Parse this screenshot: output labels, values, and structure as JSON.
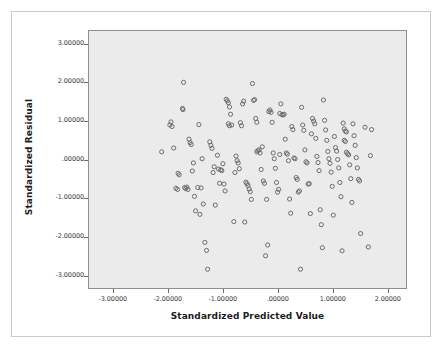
{
  "chart_data": {
    "type": "scatter",
    "title": "",
    "xlabel": "Standardized Predicted Value",
    "ylabel": "Standardized Residual",
    "xlim": [
      -3.45,
      2.35
    ],
    "ylim": [
      -3.35,
      3.35
    ],
    "xticks": [
      -3,
      -2,
      -1,
      0,
      1,
      2
    ],
    "yticks": [
      3,
      2,
      1,
      0,
      -1,
      -2,
      -3
    ],
    "xtick_labels": [
      "-3.00000",
      "-2.00000",
      "-1.00000",
      ".00000",
      "1.00000",
      "2.00000"
    ],
    "ytick_labels": [
      "3.00000",
      "2.00000",
      "1.00000",
      ".00000",
      "-1.00000",
      "-2.00000",
      "-3.00000"
    ],
    "grid": false,
    "legend": null,
    "marker": "open-circle",
    "marker_color": "#6b6b6b",
    "plot_background": "#ebebeb",
    "plot_border_color": "#8e8e8e",
    "page_background": "#ffffff",
    "n_points": 172,
    "points": [
      [
        -2.12,
        0.2
      ],
      [
        -1.95,
        0.98
      ],
      [
        -1.97,
        0.9
      ],
      [
        -1.93,
        0.86
      ],
      [
        -1.9,
        0.3
      ],
      [
        -1.72,
        2.01
      ],
      [
        -1.74,
        1.33
      ],
      [
        -1.73,
        1.3
      ],
      [
        -1.82,
        -0.36
      ],
      [
        -1.8,
        -0.4
      ],
      [
        -1.86,
        -0.75
      ],
      [
        -1.83,
        -0.78
      ],
      [
        -1.7,
        -0.73
      ],
      [
        -1.68,
        -0.76
      ],
      [
        -1.66,
        -0.72
      ],
      [
        -1.64,
        -0.78
      ],
      [
        -1.62,
        0.53
      ],
      [
        -1.6,
        0.44
      ],
      [
        -1.58,
        0.39
      ],
      [
        -1.56,
        -0.3
      ],
      [
        -1.54,
        -0.09
      ],
      [
        -1.52,
        -0.96
      ],
      [
        -1.5,
        -1.34
      ],
      [
        -1.46,
        -0.73
      ],
      [
        -1.44,
        0.91
      ],
      [
        -1.42,
        -1.43
      ],
      [
        -1.4,
        -0.74
      ],
      [
        -1.38,
        0.02
      ],
      [
        -1.36,
        -1.16
      ],
      [
        -1.33,
        -2.16
      ],
      [
        -1.3,
        -2.37
      ],
      [
        -1.28,
        -2.86
      ],
      [
        -1.24,
        0.46
      ],
      [
        -1.22,
        0.37
      ],
      [
        -1.2,
        0.29
      ],
      [
        -1.18,
        -0.34
      ],
      [
        -1.16,
        -0.19
      ],
      [
        -1.14,
        -1.19
      ],
      [
        -1.1,
        0.11
      ],
      [
        -1.08,
        -0.25
      ],
      [
        -1.06,
        -0.62
      ],
      [
        -1.04,
        -0.27
      ],
      [
        -1.02,
        -0.29
      ],
      [
        -1.0,
        -0.11
      ],
      [
        -0.98,
        -0.64
      ],
      [
        -0.96,
        -0.82
      ],
      [
        -0.94,
        1.57
      ],
      [
        -0.92,
        1.53
      ],
      [
        -0.9,
        1.48
      ],
      [
        -0.88,
        1.37
      ],
      [
        -0.86,
        1.18
      ],
      [
        -0.9,
        0.93
      ],
      [
        -0.88,
        0.88
      ],
      [
        -0.84,
        0.9
      ],
      [
        -0.8,
        -1.62
      ],
      [
        -0.78,
        -0.34
      ],
      [
        -0.76,
        0.09
      ],
      [
        -0.74,
        -0.03
      ],
      [
        -0.72,
        -0.09
      ],
      [
        -0.7,
        -0.24
      ],
      [
        -0.68,
        0.96
      ],
      [
        -0.66,
        0.88
      ],
      [
        -0.64,
        1.45
      ],
      [
        -0.62,
        1.52
      ],
      [
        -0.6,
        -1.63
      ],
      [
        -0.58,
        -0.59
      ],
      [
        -0.56,
        -0.63
      ],
      [
        -0.54,
        -0.68
      ],
      [
        -0.52,
        -0.77
      ],
      [
        -0.5,
        -0.84
      ],
      [
        -0.48,
        -1.04
      ],
      [
        -0.46,
        1.98
      ],
      [
        -0.44,
        1.54
      ],
      [
        -0.42,
        1.56
      ],
      [
        -0.4,
        1.07
      ],
      [
        -0.38,
        0.97
      ],
      [
        -0.36,
        0.23
      ],
      [
        -0.38,
        0.2
      ],
      [
        -0.34,
        0.25
      ],
      [
        -0.32,
        0.17
      ],
      [
        -0.3,
        -0.26
      ],
      [
        -0.28,
        0.33
      ],
      [
        -0.26,
        -0.56
      ],
      [
        -0.24,
        -0.62
      ],
      [
        -0.22,
        -2.51
      ],
      [
        -0.2,
        -1.04
      ],
      [
        -0.18,
        -2.23
      ],
      [
        -0.16,
        1.25
      ],
      [
        -0.14,
        1.29
      ],
      [
        -0.12,
        1.23
      ],
      [
        -0.1,
        0.97
      ],
      [
        -0.08,
        0.17
      ],
      [
        -0.06,
        0.02
      ],
      [
        -0.04,
        -0.23
      ],
      [
        -0.02,
        -0.6
      ],
      [
        0.0,
        -0.85
      ],
      [
        0.02,
        -0.78
      ],
      [
        0.04,
        0.13
      ],
      [
        0.06,
        1.45
      ],
      [
        0.04,
        1.2
      ],
      [
        0.08,
        1.17
      ],
      [
        0.1,
        1.16
      ],
      [
        0.12,
        1.18
      ],
      [
        0.14,
        0.53
      ],
      [
        0.16,
        0.17
      ],
      [
        0.18,
        0.14
      ],
      [
        0.2,
        -0.03
      ],
      [
        0.22,
        -1.03
      ],
      [
        0.24,
        -1.4
      ],
      [
        0.26,
        0.86
      ],
      [
        0.28,
        0.78
      ],
      [
        0.3,
        0.04
      ],
      [
        0.32,
        0.02
      ],
      [
        0.34,
        -0.47
      ],
      [
        0.36,
        -0.52
      ],
      [
        0.38,
        -0.85
      ],
      [
        0.4,
        -0.82
      ],
      [
        0.42,
        -2.86
      ],
      [
        0.44,
        1.36
      ],
      [
        0.46,
        0.9
      ],
      [
        0.48,
        0.76
      ],
      [
        0.5,
        0.25
      ],
      [
        0.52,
        -0.06
      ],
      [
        0.54,
        -0.09
      ],
      [
        0.56,
        -0.64
      ],
      [
        0.58,
        -0.63
      ],
      [
        0.6,
        -1.41
      ],
      [
        0.62,
        0.67
      ],
      [
        0.64,
        1.07
      ],
      [
        0.66,
        1.0
      ],
      [
        0.68,
        0.93
      ],
      [
        0.7,
        0.55
      ],
      [
        0.72,
        0.08
      ],
      [
        0.74,
        -0.08
      ],
      [
        0.76,
        -0.29
      ],
      [
        0.78,
        -1.31
      ],
      [
        0.8,
        -1.7
      ],
      [
        0.82,
        -2.3
      ],
      [
        0.84,
        1.55
      ],
      [
        0.86,
        1.02
      ],
      [
        0.88,
        0.77
      ],
      [
        0.9,
        0.5
      ],
      [
        0.92,
        0.21
      ],
      [
        0.94,
        0.02
      ],
      [
        0.96,
        -0.1
      ],
      [
        0.98,
        -0.33
      ],
      [
        1.0,
        -0.7
      ],
      [
        1.02,
        -1.45
      ],
      [
        1.04,
        0.6
      ],
      [
        1.06,
        0.31
      ],
      [
        1.08,
        0.22
      ],
      [
        1.1,
        0.0
      ],
      [
        1.12,
        -0.22
      ],
      [
        1.14,
        -0.6
      ],
      [
        1.16,
        -0.97
      ],
      [
        1.18,
        -2.38
      ],
      [
        1.2,
        0.95
      ],
      [
        1.22,
        0.8
      ],
      [
        1.24,
        0.74
      ],
      [
        1.26,
        0.72
      ],
      [
        1.22,
        0.5
      ],
      [
        1.24,
        0.47
      ],
      [
        1.26,
        0.19
      ],
      [
        1.28,
        0.15
      ],
      [
        1.3,
        0.12
      ],
      [
        1.32,
        -0.14
      ],
      [
        1.34,
        -0.5
      ],
      [
        1.36,
        -1.12
      ],
      [
        1.38,
        0.93
      ],
      [
        1.4,
        0.62
      ],
      [
        1.42,
        0.37
      ],
      [
        1.44,
        0.05
      ],
      [
        1.46,
        -0.22
      ],
      [
        1.48,
        -0.52
      ],
      [
        1.5,
        -0.56
      ],
      [
        1.52,
        -1.93
      ],
      [
        1.6,
        0.84
      ],
      [
        1.66,
        -2.28
      ],
      [
        1.72,
        0.78
      ],
      [
        1.7,
        0.1
      ]
    ]
  }
}
